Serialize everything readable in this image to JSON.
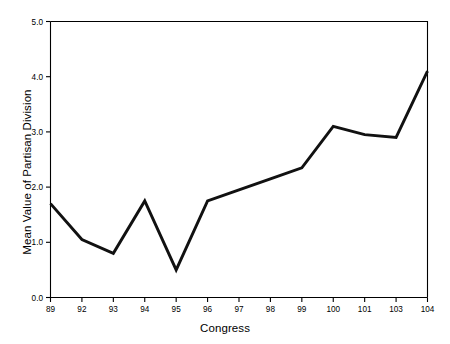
{
  "chart_data": {
    "type": "line",
    "title": "",
    "xlabel": "Congress",
    "ylabel": "Mean Value of Partisan Division",
    "categories": [
      "89",
      "92",
      "93",
      "94",
      "95",
      "96",
      "97",
      "98",
      "99",
      "100",
      "101",
      "103",
      "104"
    ],
    "values": [
      1.7,
      1.05,
      0.8,
      1.75,
      0.5,
      1.75,
      1.95,
      2.15,
      2.35,
      3.1,
      2.95,
      2.9,
      4.1
    ],
    "x_tick_labels": [
      "89",
      "92",
      "93",
      "94",
      "95",
      "96",
      "97",
      "98",
      "99",
      "100",
      "101",
      "103",
      "104"
    ],
    "y_tick_labels": [
      "0.0",
      "1.0",
      "2.0",
      "3.0",
      "4.0",
      "5.0"
    ],
    "y_tick_values": [
      0.0,
      1.0,
      2.0,
      3.0,
      4.0,
      5.0
    ],
    "ylim": [
      0.0,
      5.0
    ],
    "grid": false,
    "legend": null,
    "series_color": "#111111"
  }
}
